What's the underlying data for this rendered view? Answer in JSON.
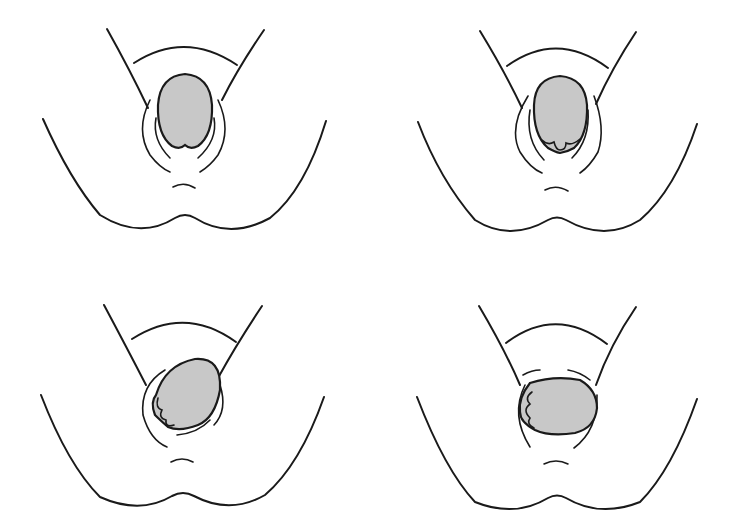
{
  "figure": {
    "colors": {
      "stroke": "#1a1a1a",
      "head_fill": "#c8c8c8",
      "background": "#ffffff"
    },
    "panels": [
      {
        "id": 1,
        "position": "top-left",
        "head_orientation": "vertical, occiput anterior, crowning"
      },
      {
        "id": 2,
        "position": "top-right",
        "head_orientation": "vertical, face emerging (features visible at bottom)"
      },
      {
        "id": 3,
        "position": "bottom-left",
        "head_orientation": "tilted diagonal, restitution"
      },
      {
        "id": 4,
        "position": "bottom-right",
        "head_orientation": "horizontal, external rotation, face to left"
      }
    ]
  }
}
